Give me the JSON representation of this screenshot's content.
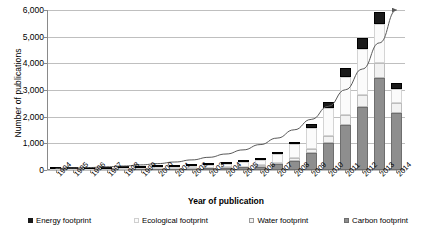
{
  "chart_data": {
    "type": "bar",
    "stacked": true,
    "title": "",
    "xlabel": "Year of publication",
    "ylabel": "Number of publications",
    "ylim": [
      0,
      6000
    ],
    "ytick_values": [
      0,
      1000,
      2000,
      3000,
      4000,
      5000,
      6000
    ],
    "ytick_labels": [
      "0",
      "1,000",
      "2,000",
      "3,000",
      "4,000",
      "5,000",
      "6,000"
    ],
    "grid": true,
    "legend_position": "bottom",
    "categories": [
      "1994",
      "1995",
      "1996",
      "1997",
      "1998",
      "1999",
      "2000",
      "2001",
      "2002",
      "2003",
      "2004",
      "2005",
      "2006",
      "2007",
      "2008",
      "2009",
      "2010",
      "2011",
      "2012",
      "2013",
      "2014"
    ],
    "series": [
      {
        "name": "Carbon footprint",
        "color": "#8e8e8e",
        "values": [
          5,
          8,
          10,
          14,
          18,
          22,
          30,
          38,
          48,
          60,
          75,
          95,
          130,
          210,
          330,
          620,
          1000,
          1700,
          2350,
          3450,
          2150
        ]
      },
      {
        "name": "Water footprint",
        "color": "#f2f2f2",
        "values": [
          3,
          4,
          5,
          6,
          8,
          10,
          12,
          15,
          18,
          22,
          28,
          35,
          45,
          70,
          110,
          180,
          270,
          380,
          480,
          560,
          380
        ]
      },
      {
        "name": "Ecological footprint",
        "color": "#fbfbfb",
        "values": [
          20,
          24,
          28,
          34,
          40,
          48,
          58,
          70,
          85,
          105,
          130,
          160,
          200,
          320,
          520,
          760,
          1060,
          1420,
          1720,
          1480,
          500
        ]
      },
      {
        "name": "Energy footprint",
        "color": "#1a1a1a",
        "values": [
          2,
          2,
          3,
          4,
          5,
          6,
          8,
          10,
          13,
          16,
          20,
          26,
          34,
          60,
          100,
          160,
          230,
          320,
          400,
          420,
          230
        ]
      }
    ],
    "totals": [
      30,
      38,
      46,
      58,
      71,
      86,
      108,
      133,
      164,
      203,
      253,
      316,
      409,
      660,
      1060,
      1720,
      2560,
      3820,
      4950,
      5910,
      3260
    ],
    "trendline": {
      "present": true,
      "style": "curved-with-arrowhead",
      "color": "#595959",
      "start_value": 60,
      "end_value": 6000
    }
  },
  "legend": {
    "items": [
      {
        "label": "Energy footprint",
        "swatch": "energy-swatch"
      },
      {
        "label": "Ecological footprint",
        "swatch": "ecological-swatch"
      },
      {
        "label": "Water footprint",
        "swatch": "water-swatch"
      },
      {
        "label": "Carbon footprint",
        "swatch": "carbon-swatch"
      }
    ]
  }
}
